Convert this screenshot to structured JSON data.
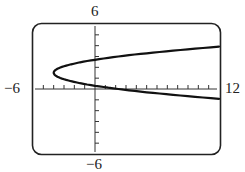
{
  "chart_data": {
    "type": "line",
    "title": "",
    "xlabel": "",
    "ylabel": "",
    "xlim": [
      -6,
      12
    ],
    "ylim": [
      -6,
      6
    ],
    "x_tick_step": 1,
    "y_tick_step": 1,
    "grid": false,
    "axis_labels": {
      "xmin": "−6",
      "xmax": "12",
      "ymax": "6",
      "ymin": "−6"
    },
    "series": [
      {
        "name": "parabola opening right",
        "description": "x = k(y - 1.5)^2 - 4, vertex near (-4, 1.5)",
        "points": [
          {
            "x": 12,
            "y": 3.5
          },
          {
            "x": 6,
            "y": 3.1
          },
          {
            "x": 0,
            "y": 2.7
          },
          {
            "x": -2,
            "y": 2.4
          },
          {
            "x": -4,
            "y": 1.5
          },
          {
            "x": -2,
            "y": 0.6
          },
          {
            "x": 0,
            "y": 0.3
          },
          {
            "x": 6,
            "y": -0.2
          },
          {
            "x": 12,
            "y": -0.6
          }
        ]
      }
    ]
  }
}
